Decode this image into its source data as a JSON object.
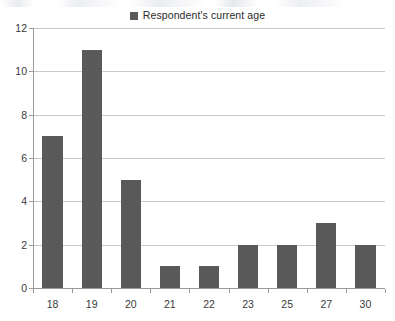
{
  "chart_data": {
    "type": "bar",
    "title": "",
    "subtitle": "",
    "xlabel": "",
    "ylabel": "",
    "categories": [
      "18",
      "19",
      "20",
      "21",
      "22",
      "23",
      "25",
      "27",
      "30"
    ],
    "values": [
      7,
      11,
      5,
      1,
      1,
      2,
      2,
      3,
      2
    ],
    "series": [
      {
        "name": "Respondent's current age",
        "values": [
          7,
          11,
          5,
          1,
          1,
          2,
          2,
          3,
          2
        ],
        "color": "#595959"
      }
    ],
    "ylim": [
      0,
      12
    ],
    "ytick_step": 2,
    "yticks": [
      "12",
      "10",
      "8",
      "6",
      "4",
      "2",
      "0"
    ],
    "ytick_values": [
      12,
      10,
      8,
      6,
      4,
      2,
      0
    ],
    "grid": "horizontal",
    "legend_position": "top-center",
    "background_color": "#ffffff",
    "gridline_color": "#c9c9c9",
    "axis_color": "#9a9a9a",
    "bar_color": "#595959"
  },
  "legend": {
    "entries": [
      {
        "label": "Respondent's current age",
        "color": "#595959",
        "marker": "square"
      }
    ]
  }
}
